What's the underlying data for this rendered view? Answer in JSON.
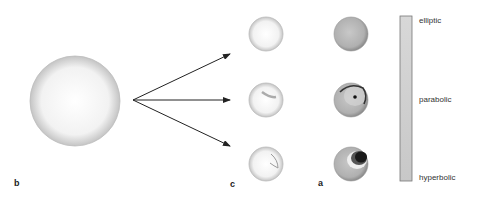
{
  "panels": {
    "a": "a",
    "b": "b",
    "c": "c"
  },
  "scale_bar": {
    "labels": [
      "elliptic",
      "parabolic",
      "hyperbolic"
    ]
  },
  "colors": {
    "arrow": "#222222",
    "sphere_light": "#f4f4f4",
    "sphere_gray": "#b8b8b8",
    "bar_fill": "#cfcfcf",
    "dark_region": "#1a1a1a"
  }
}
